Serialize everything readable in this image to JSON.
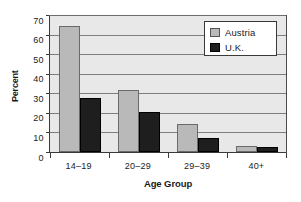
{
  "chart_data": {
    "type": "bar",
    "title": "",
    "xlabel": "Age Group",
    "ylabel": "Percent",
    "categories": [
      "14–19",
      "20–29",
      "29–39",
      "40+"
    ],
    "series": [
      {
        "name": "Austria",
        "color": "#b9b9b9",
        "values": [
          64.5,
          31.5,
          14.5,
          3.0
        ]
      },
      {
        "name": "U.K.",
        "color": "#1e1e1e",
        "values": [
          27.8,
          20.3,
          7.4,
          2.5
        ]
      }
    ],
    "ylim": [
      0,
      70
    ],
    "yticks": [
      0,
      10,
      20,
      30,
      40,
      50,
      60,
      70
    ],
    "ytick_labels": [
      "0",
      "10",
      "20",
      "30",
      "40",
      "50",
      "60",
      "70"
    ],
    "grid": true,
    "grid_axis": "y",
    "legend_position": "top-right",
    "plot_background": "#e8e8e8",
    "figure_background": "#ffffff"
  },
  "legend": {
    "entries": [
      {
        "label": "Austria",
        "swatch": "legend-swatch-austria"
      },
      {
        "label": "U.K.",
        "swatch": "legend-swatch-uk"
      }
    ]
  }
}
